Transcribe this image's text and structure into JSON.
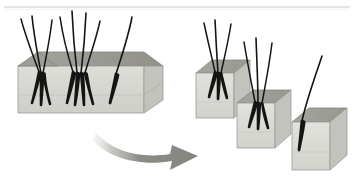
{
  "illustration": {
    "title": "Hair follicular unit graft dissection",
    "subject": "hair-transplant-graft-splitting",
    "background_color": "#ffffff",
    "width": 355,
    "height": 191
  },
  "palette": {
    "block_top_face": "#9a9a95",
    "block_top_face_dark": "#8e8e89",
    "block_front_face": "#d8d8d2",
    "block_front_face_light": "#e4e4df",
    "block_side_face": "#bdbdb7",
    "block_outline": "#8a8a85",
    "hair_color": "#111111",
    "arrow_color": "#8c8c87",
    "arrow_color_light": "#d5d5d0",
    "top_rule_color": "#d9d9d4"
  },
  "top_rule": {
    "present": true,
    "y": 7,
    "x_start": 4,
    "x_end": 350
  },
  "donor_block": {
    "label": "Donor strip graft",
    "hair_cluster_count": 3,
    "total_hairs": 8,
    "clusters": [
      {
        "name": "cluster-left",
        "hairs": 3
      },
      {
        "name": "cluster-middle",
        "hairs": 4
      },
      {
        "name": "cluster-right",
        "hairs": 1
      }
    ]
  },
  "arrow": {
    "label": "dissection arrow",
    "direction": "left-to-right",
    "style": "curved-sweep-faded-tail"
  },
  "recipient_blocks": [
    {
      "name": "graft-1",
      "label": "Follicular unit graft 1",
      "hairs": 3,
      "position": "upper"
    },
    {
      "name": "graft-2",
      "label": "Follicular unit graft 2",
      "hairs": 3,
      "position": "middle"
    },
    {
      "name": "graft-3",
      "label": "Single hair graft",
      "hairs": 1,
      "position": "lower"
    }
  ]
}
